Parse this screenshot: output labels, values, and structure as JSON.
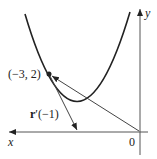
{
  "diagram": {
    "axes": {
      "x_label": "x",
      "y_label": "y",
      "origin_label": "0"
    },
    "point_label": "(−3, 2)",
    "vector_label_bold": "r",
    "vector_label_rest": "′(−1)",
    "colors": {
      "ink": "#222222",
      "background": "#ffffff"
    }
  }
}
